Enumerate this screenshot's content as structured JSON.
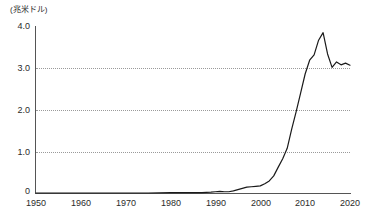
{
  "chart_data": {
    "type": "line",
    "title": "",
    "subtitle": "",
    "xlabel": "",
    "ylabel": "",
    "unit_label": "(兆米ドル)",
    "xlim": [
      1950,
      2020
    ],
    "ylim": [
      0,
      4.0
    ],
    "grid": "horizontal-dotted",
    "legend": "none",
    "y_ticks": [
      "4.0",
      "3.0",
      "2.0",
      "1.0",
      "0"
    ],
    "y_tick_values": [
      4.0,
      3.0,
      2.0,
      1.0,
      0
    ],
    "x_ticks": [
      "1950",
      "1960",
      "1970",
      "1980",
      "1990",
      "2000",
      "2010",
      "2020"
    ],
    "x_tick_values": [
      1950,
      1960,
      1970,
      1980,
      1990,
      2000,
      2010,
      2020
    ],
    "gridline_values": [
      3.0,
      2.0,
      1.0
    ],
    "series": [
      {
        "name": "",
        "color": "#1a1a1a",
        "x": [
          1950,
          1955,
          1960,
          1965,
          1970,
          1975,
          1980,
          1983,
          1985,
          1987,
          1989,
          1990,
          1991,
          1992,
          1993,
          1994,
          1995,
          1996,
          1997,
          1998,
          1999,
          2000,
          2001,
          2002,
          2003,
          2004,
          2005,
          2006,
          2007,
          2008,
          2009,
          2010,
          2011,
          2012,
          2013,
          2014,
          2015,
          2016,
          2017,
          2018,
          2019,
          2020
        ],
        "values": [
          0.0,
          0.0,
          0.0,
          0.0,
          0.0,
          0.0,
          0.01,
          0.01,
          0.01,
          0.01,
          0.02,
          0.03,
          0.04,
          0.03,
          0.03,
          0.05,
          0.08,
          0.11,
          0.14,
          0.15,
          0.16,
          0.17,
          0.22,
          0.29,
          0.41,
          0.62,
          0.82,
          1.07,
          1.53,
          1.95,
          2.4,
          2.85,
          3.18,
          3.31,
          3.66,
          3.84,
          3.33,
          3.01,
          3.14,
          3.07,
          3.11,
          3.06
        ]
      }
    ]
  }
}
